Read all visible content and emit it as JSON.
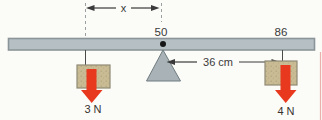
{
  "figure": {
    "labels": {
      "x_dimension": "x",
      "pivot_mark": "50",
      "right_mark": "86",
      "distance": "36 cm",
      "left_force": "3 N",
      "right_force": "4 N"
    },
    "colors": {
      "background": "#fbfbf8",
      "beam_fill": "#b6c0c4",
      "beam_stroke": "#8b9599",
      "fulcrum_fill": "#a9b3b7",
      "fulcrum_stroke": "#6f7b7f",
      "weight_fill": "#c9bb93",
      "weight_speckle": "#a89d76",
      "weight_stroke": "#8f8a74",
      "force_arrow": "#e8391f",
      "dimension_line": "#3a3a3a",
      "dashed_line": "#9aa0a2",
      "page_edge": "#eab1ac"
    }
  }
}
